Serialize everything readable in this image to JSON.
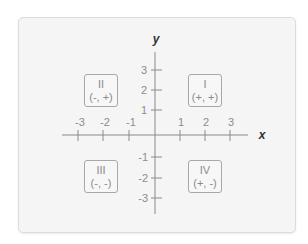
{
  "diagram": {
    "axes": {
      "x_label": "x",
      "y_label": "y",
      "x_ticks": [
        {
          "value": -3,
          "label": "-3"
        },
        {
          "value": -2,
          "label": "-2"
        },
        {
          "value": -1,
          "label": "-1"
        },
        {
          "value": 1,
          "label": "1"
        },
        {
          "value": 2,
          "label": "2"
        },
        {
          "value": 3,
          "label": "3"
        }
      ],
      "y_ticks": [
        {
          "value": 3,
          "label": "3"
        },
        {
          "value": 2,
          "label": "2"
        },
        {
          "value": 1,
          "label": "1"
        },
        {
          "value": -1,
          "label": "-1"
        },
        {
          "value": -2,
          "label": "-2"
        },
        {
          "value": -3,
          "label": "-3"
        }
      ]
    },
    "quadrants": [
      {
        "numeral": "I",
        "signs": "(+, +)",
        "position": "top-right"
      },
      {
        "numeral": "II",
        "signs": "(-, +)",
        "position": "top-left"
      },
      {
        "numeral": "III",
        "signs": "(-, -)",
        "position": "bottom-left"
      },
      {
        "numeral": "IV",
        "signs": "(+, -)",
        "position": "bottom-right"
      }
    ],
    "colors": {
      "card_background": "#f5f5f5",
      "axis": "#8a8a8a",
      "text": "#8c8c8c",
      "axis_label": "#333333"
    }
  }
}
